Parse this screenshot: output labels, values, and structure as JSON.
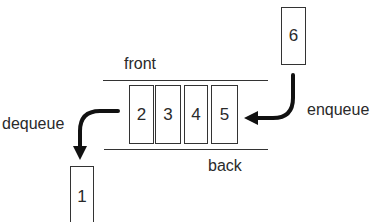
{
  "diagram": {
    "type": "queue",
    "labels": {
      "front": "front",
      "back": "back",
      "enqueue": "enqueue",
      "dequeue": "dequeue"
    },
    "queue_items": [
      "2",
      "3",
      "4",
      "5"
    ],
    "incoming_item": "6",
    "outgoing_item": "1",
    "colors": {
      "stroke": "#333333",
      "text": "#2a2a2a",
      "background": "#ffffff"
    }
  }
}
